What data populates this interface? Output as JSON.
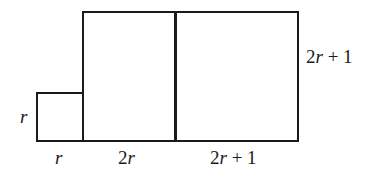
{
  "diagram": {
    "type": "area-model",
    "stroke_color": "#1a1a1a",
    "shapes": [
      {
        "id": "small-square",
        "width_label": "r",
        "height_label": "r"
      },
      {
        "id": "middle-rect",
        "width_label": "2r",
        "height_label": "2r + 1"
      },
      {
        "id": "right-square",
        "width_label": "2r + 1",
        "height_label": "2r + 1"
      }
    ],
    "labels": {
      "small_side": {
        "var": "r",
        "rest": ""
      },
      "small_bottom": {
        "var": "r",
        "rest": ""
      },
      "middle_bottom": {
        "coef": "2",
        "var": "r",
        "rest": ""
      },
      "right_bottom": {
        "coef": "2",
        "var": "r",
        "rest": " + 1"
      },
      "right_side": {
        "coef": "2",
        "var": "r",
        "rest": " + 1"
      }
    }
  }
}
